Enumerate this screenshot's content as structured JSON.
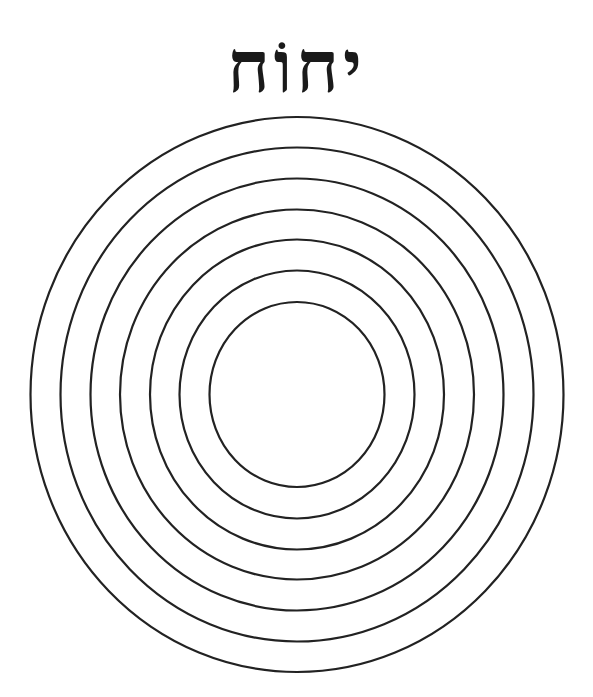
{
  "title": {
    "text": "יחוֹח"
  },
  "diagram": {
    "center": [
      297,
      394.5
    ],
    "stroke_color": "#222222",
    "stroke_width": 2.2,
    "rings": [
      {
        "rx": 266.5,
        "ry": 277.5
      },
      {
        "rx": 236.5,
        "ry": 247
      },
      {
        "rx": 206.5,
        "ry": 216
      },
      {
        "rx": 177,
        "ry": 185
      },
      {
        "rx": 147,
        "ry": 155
      },
      {
        "rx": 117.5,
        "ry": 124
      },
      {
        "rx": 87.5,
        "ry": 92.5
      }
    ]
  }
}
